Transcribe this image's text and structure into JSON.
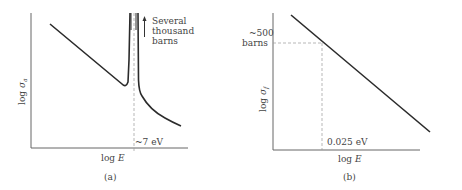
{
  "panel_a": {
    "caption": "(a)",
    "y_label_prefix": "log ",
    "y_label_symbol": "σ",
    "y_label_sub": "a",
    "x_label_prefix": "log ",
    "x_label_symbol": "E",
    "resonance_label": "~7 eV",
    "peak_note_line1": "Several",
    "peak_note_line2": "thousand",
    "peak_note_line3": "barns"
  },
  "panel_b": {
    "caption": "(b)",
    "y_label_prefix": "log ",
    "y_label_symbol": "σ",
    "y_label_sub": "f",
    "x_label_prefix": "log ",
    "x_label_symbol": "E",
    "y_marker_line1": "~500",
    "y_marker_line2": "barns",
    "x_marker_label": "0.025 eV"
  },
  "colors": {
    "curve": "#2b2b2b",
    "axis": "#555555",
    "dashed": "#888888",
    "text": "#444444"
  }
}
